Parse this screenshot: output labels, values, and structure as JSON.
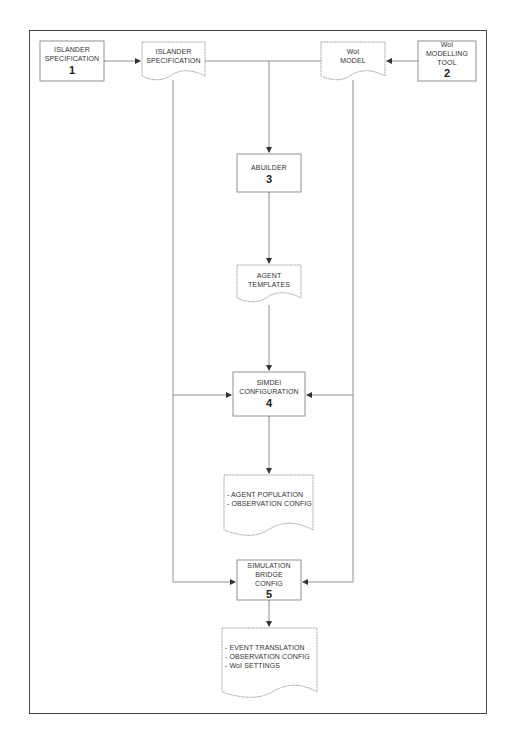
{
  "diagram": {
    "processes": [
      {
        "id": "p1",
        "label_lines": [
          "ISLANDER",
          "SPECIFICATION"
        ],
        "number": "1"
      },
      {
        "id": "p2",
        "label_lines": [
          "WoI",
          "MODELLING",
          "TOOL"
        ],
        "number": "2"
      },
      {
        "id": "p3",
        "label_lines": [
          "ABUILDER"
        ],
        "number": "3"
      },
      {
        "id": "p4",
        "label_lines": [
          "SIMDEI",
          "CONFIGURATION"
        ],
        "number": "4"
      },
      {
        "id": "p5",
        "label_lines": [
          "SIMULATION",
          "BRIDGE",
          "CONFIG"
        ],
        "number": "5"
      }
    ],
    "documents": [
      {
        "id": "d1",
        "label_lines": [
          "ISLANDER",
          "SPECIFICATION"
        ]
      },
      {
        "id": "d2",
        "label_lines": [
          "WoI",
          "MODEL"
        ]
      },
      {
        "id": "d3",
        "label_lines": [
          "AGENT",
          "TEMPLATES"
        ]
      },
      {
        "id": "d4",
        "label_lines": [
          "- AGENT POPULATION",
          "- OBSERVATION CONFIG"
        ]
      },
      {
        "id": "d5",
        "label_lines": [
          "- EVENT TRANSLATION",
          "- OBSERVATION CONFIG",
          "- WoI SETTINGS"
        ]
      }
    ],
    "edges": [
      {
        "from": "p1",
        "to": "d1"
      },
      {
        "from": "p2",
        "to": "d2"
      },
      {
        "from": "d1",
        "to": "p3"
      },
      {
        "from": "d2",
        "to": "p3"
      },
      {
        "from": "p3",
        "to": "d3"
      },
      {
        "from": "d3",
        "to": "p4"
      },
      {
        "from": "d1",
        "to": "p4"
      },
      {
        "from": "d2",
        "to": "p4"
      },
      {
        "from": "p4",
        "to": "d4"
      },
      {
        "from": "d1",
        "to": "p5"
      },
      {
        "from": "d2",
        "to": "p5"
      },
      {
        "from": "p5",
        "to": "d5"
      }
    ],
    "colors": {
      "line": "#777777",
      "frame": "#444444",
      "text": "#333333"
    }
  }
}
